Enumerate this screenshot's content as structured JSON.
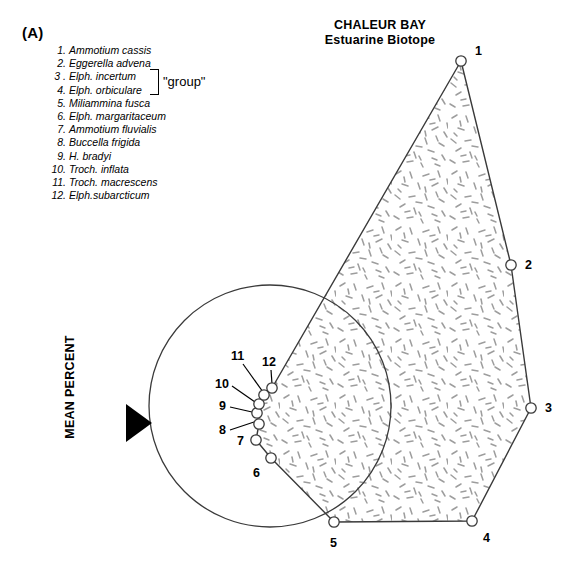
{
  "panel": {
    "letter": "(A)"
  },
  "title": {
    "line1": "CHALEUR BAY",
    "line2": "Estuarine Biotope"
  },
  "axis": {
    "y_label": "MEAN PERCENT",
    "arrow_icon": "triangle-right-icon"
  },
  "legend": {
    "group_annotation": "\"group\"",
    "items": [
      {
        "num": "1.",
        "name": "Ammotium cassis"
      },
      {
        "num": "2.",
        "name": "Eggerella advena"
      },
      {
        "num": "3 .",
        "name": "Elph. incertum"
      },
      {
        "num": "4.",
        "name": "Elph. orbiculare"
      },
      {
        "num": "5.",
        "name": "Miliammina fusca"
      },
      {
        "num": "6.",
        "name": "Elph. margaritaceum"
      },
      {
        "num": "7.",
        "name": "Ammotium fluvialis"
      },
      {
        "num": "8.",
        "name": "Buccella frigida"
      },
      {
        "num": "9.",
        "name": "H. bradyi"
      },
      {
        "num": "10.",
        "name": "Troch. inflata"
      },
      {
        "num": "11.",
        "name": "Troch. macrescens"
      },
      {
        "num": "12.",
        "name": "Elph.subarcticum"
      }
    ]
  },
  "colors": {
    "outline": "#3a3a3a",
    "stipple": "#9a9a9a",
    "text": "#000000",
    "marker_fill": "#ffffff"
  },
  "chart_data": {
    "type": "scatter",
    "title": "CHALEUR BAY Estuarine Biotope",
    "xlabel": "",
    "ylabel": "MEAN PERCENT",
    "grid": false,
    "legend_position": "top-left",
    "points": [
      {
        "label": "1",
        "species": "Ammotium cassis",
        "x": 461,
        "y": 61,
        "label_dx": 14,
        "label_dy": -6
      },
      {
        "label": "2",
        "species": "Eggerella advena",
        "x": 511,
        "y": 265,
        "label_dx": 14,
        "label_dy": 4
      },
      {
        "label": "3",
        "species": "Elph. incertum",
        "x": 531,
        "y": 408,
        "label_dx": 14,
        "label_dy": 4
      },
      {
        "label": "4",
        "species": "Elph. orbiculare",
        "x": 472,
        "y": 521,
        "label_dx": 11,
        "label_dy": 21
      },
      {
        "label": "5",
        "species": "Miliammina fusca",
        "x": 334,
        "y": 522,
        "label_dx": -4,
        "label_dy": 25
      },
      {
        "label": "6",
        "species": "Elph. margaritaceum",
        "x": 271,
        "y": 458,
        "label_dx": -18,
        "label_dy": 19
      },
      {
        "label": "7",
        "species": "Ammotium fluvialis",
        "x": 256,
        "y": 440,
        "label_dx": -19,
        "label_dy": 5
      },
      {
        "label": "8",
        "species": "Buccella frigida",
        "x": 259,
        "y": 424,
        "label_dx": 0,
        "label_dy": 0
      },
      {
        "label": "9",
        "species": "H. bradyi",
        "x": 257,
        "y": 413,
        "label_dx": 0,
        "label_dy": 0
      },
      {
        "label": "10",
        "species": "Troch. inflata",
        "x": 259,
        "y": 404,
        "label_dx": 0,
        "label_dy": 0
      },
      {
        "label": "11",
        "species": "Troch. macrescens",
        "x": 264,
        "y": 395,
        "label_dx": 0,
        "label_dy": 0
      },
      {
        "label": "12",
        "species": "Elph.subarcticum",
        "x": 272,
        "y": 388,
        "label_dx": 0,
        "label_dy": 0
      }
    ],
    "leader_labels": [
      {
        "label": "11",
        "text_x": 231,
        "text_y": 360,
        "line_x1": 243,
        "line_y1": 364,
        "line_x2": 263,
        "line_y2": 392
      },
      {
        "label": "12",
        "text_x": 262,
        "text_y": 366,
        "line_x1": 271,
        "line_y1": 370,
        "line_x2": 272,
        "line_y2": 384
      },
      {
        "label": "10",
        "text_x": 215,
        "text_y": 388,
        "line_x1": 232,
        "line_y1": 386,
        "line_x2": 255,
        "line_y2": 402
      },
      {
        "label": "9",
        "text_x": 219,
        "text_y": 410,
        "line_x1": 230,
        "line_y1": 407,
        "line_x2": 252,
        "line_y2": 412
      },
      {
        "label": "8",
        "text_x": 219,
        "text_y": 434,
        "line_x1": 230,
        "line_y1": 430,
        "line_x2": 254,
        "line_y2": 422
      }
    ],
    "circle": {
      "cx": 270,
      "cy": 406,
      "r": 121
    },
    "polygon_path": [
      [
        461,
        61
      ],
      [
        511,
        265
      ],
      [
        531,
        408
      ],
      [
        472,
        521
      ],
      [
        334,
        522
      ],
      [
        271,
        458
      ],
      [
        256,
        440
      ],
      [
        259,
        424
      ],
      [
        257,
        413
      ],
      [
        259,
        404
      ],
      [
        264,
        395
      ],
      [
        272,
        388
      ]
    ]
  }
}
